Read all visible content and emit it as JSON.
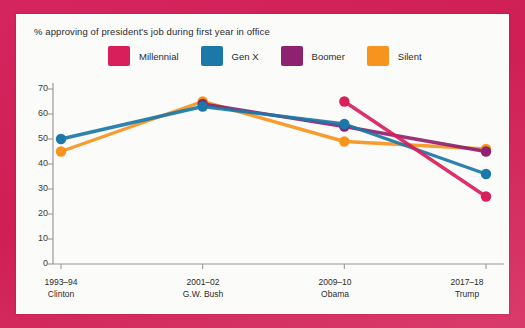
{
  "chart_data": {
    "type": "line",
    "title": "% approving of president's job during first year in office",
    "xlabel": "",
    "ylabel": "",
    "ylim": [
      0,
      70
    ],
    "yticks": [
      0,
      10,
      20,
      30,
      40,
      50,
      60,
      70
    ],
    "grid": false,
    "legend_position": "top",
    "categories": [
      "1993–94",
      "2001–02",
      "2009–10",
      "2017–18"
    ],
    "category_sublabels": [
      "Clinton",
      "G.W. Bush",
      "Obama",
      "Trump"
    ],
    "series": [
      {
        "name": "Millennial",
        "color": "#d81e5b",
        "values": [
          null,
          null,
          65,
          27
        ]
      },
      {
        "name": "Gen X",
        "color": "#1b78a8",
        "values": [
          50,
          63,
          56,
          36
        ]
      },
      {
        "name": "Boomer",
        "color": "#8e2170",
        "values": [
          null,
          64,
          55,
          45
        ]
      },
      {
        "name": "Silent",
        "color": "#f7941e",
        "values": [
          45,
          65,
          49,
          46
        ]
      }
    ]
  },
  "legend": {
    "items": [
      {
        "label": "Millennial",
        "color": "#d81e5b",
        "swatch_name": "legend-swatch-millennial"
      },
      {
        "label": "Gen X",
        "color": "#1b78a8",
        "swatch_name": "legend-swatch-gen-x"
      },
      {
        "label": "Boomer",
        "color": "#8e2170",
        "swatch_name": "legend-swatch-boomer"
      },
      {
        "label": "Silent",
        "color": "#f7941e",
        "swatch_name": "legend-swatch-silent"
      }
    ]
  },
  "axis": {
    "y_labels": [
      "70",
      "60",
      "50",
      "40",
      "30",
      "20",
      "10",
      "0"
    ],
    "x_labels": [
      {
        "year": "1993–94",
        "president": "Clinton"
      },
      {
        "year": "2001–02",
        "president": "G.W. Bush"
      },
      {
        "year": "2009–10",
        "president": "Obama"
      },
      {
        "year": "2017–18",
        "president": "Trump"
      }
    ]
  },
  "colors": {
    "frame": "#d4255f",
    "card": "#fbfbfa",
    "axis": "#9a9a9a",
    "text": "#2b2b2b"
  }
}
